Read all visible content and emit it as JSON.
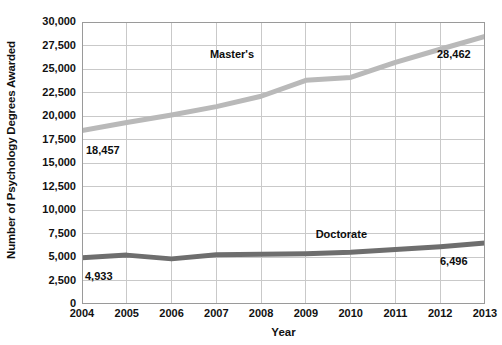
{
  "chart_data": {
    "type": "line",
    "title": "",
    "xlabel": "Year",
    "ylabel": "Number of Psychology Degrees Awarded",
    "categories": [
      "2004",
      "2005",
      "2006",
      "2007",
      "2008",
      "2009",
      "2010",
      "2011",
      "2012",
      "2013"
    ],
    "x": [
      2004,
      2005,
      2006,
      2007,
      2008,
      2009,
      2010,
      2011,
      2012,
      2013
    ],
    "xlim": [
      2004,
      2013
    ],
    "ylim": [
      0,
      30000
    ],
    "ytick_step": 2500,
    "grid": true,
    "legend_position": "inline-labels",
    "series": [
      {
        "name": "Master's",
        "color": "#b9b9b9",
        "values": [
          18457,
          19300,
          20100,
          21000,
          22100,
          23800,
          24100,
          25700,
          27100,
          28462
        ],
        "label_point_index": 5,
        "start_label": "18,457",
        "end_label": "28,462"
      },
      {
        "name": "Doctorate",
        "color": "#6e6e6e",
        "values": [
          4933,
          5200,
          4800,
          5250,
          5300,
          5350,
          5500,
          5800,
          6100,
          6496
        ],
        "label_point_index": 6,
        "start_label": "4,933",
        "end_label": "6,496"
      }
    ],
    "ytick_labels": [
      "0",
      "2,500",
      "5,000",
      "7,500",
      "10,000",
      "12,500",
      "15,000",
      "17,500",
      "20,000",
      "22,500",
      "25,000",
      "27,500",
      "30,000"
    ],
    "annotations": [
      {
        "name": "masters-start-value",
        "text": "18,457"
      },
      {
        "name": "masters-end-value",
        "text": "28,462"
      },
      {
        "name": "doctorate-start-value",
        "text": "4,933"
      },
      {
        "name": "doctorate-end-value",
        "text": "6,496"
      }
    ],
    "series_inline_labels": [
      {
        "name": "masters-series-label",
        "text": "Master's"
      },
      {
        "name": "doctorate-series-label",
        "text": "Doctorate"
      }
    ],
    "colors": {
      "grid": "#c9c9c9",
      "axis": "#9a9a9a",
      "text": "#111111",
      "masters": "#b9b9b9",
      "doctorate": "#6e6e6e",
      "background": "#ffffff"
    }
  }
}
